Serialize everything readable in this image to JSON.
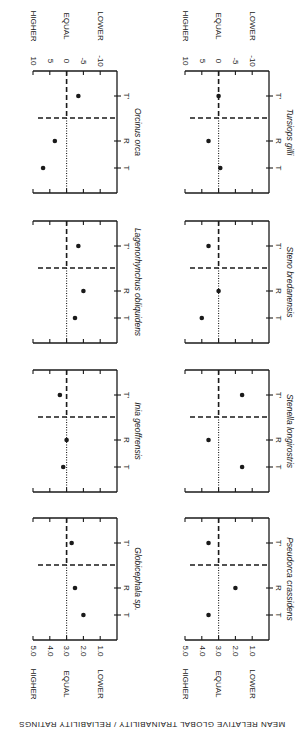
{
  "figure": {
    "ylabel": "MEAN RELATIVE GLOBAL TRAINABILITY / RELIABILITY RATINGS",
    "left_axis_ticks": [
      "5.0",
      "4.0",
      "3.0",
      "2.0",
      "1.0"
    ],
    "right_axis_ticks": [
      "10",
      "5",
      "0",
      "-5",
      "-10"
    ],
    "level_labels": [
      "HIGHER",
      "EQUAL",
      "LOWER"
    ],
    "categories": [
      "T",
      "R",
      "T'"
    ]
  },
  "chart_data": [
    {
      "type": "scatter",
      "title": "Globicephala sp.",
      "column": 0,
      "row": 3,
      "axis": "left",
      "categories": [
        "T",
        "R",
        "T'"
      ],
      "values": [
        2.0,
        2.5,
        2.7
      ],
      "ylim": [
        1.0,
        5.0
      ],
      "reference": 3.0
    },
    {
      "type": "scatter",
      "title": "Inia geoffrensis",
      "column": 0,
      "row": 2,
      "axis": "left",
      "categories": [
        "T",
        "R",
        "T'"
      ],
      "values": [
        3.2,
        3.0,
        3.4
      ],
      "ylim": [
        1.0,
        5.0
      ],
      "reference": 3.0
    },
    {
      "type": "scatter",
      "title": "Lagenorhynchus obliquidens",
      "column": 0,
      "row": 1,
      "axis": "left",
      "categories": [
        "T",
        "R",
        "T'"
      ],
      "values": [
        2.5,
        2.0,
        2.3
      ],
      "ylim": [
        1.0,
        5.0
      ],
      "reference": 3.0
    },
    {
      "type": "scatter",
      "title": "Orcinus orca",
      "column": 0,
      "row": 0,
      "axis": "right",
      "categories": [
        "T",
        "R",
        "T'"
      ],
      "values": [
        7,
        3.5,
        -3.5
      ],
      "ylim": [
        -10,
        10
      ],
      "reference": 0
    },
    {
      "type": "scatter",
      "title": "Pseudorca crassidens",
      "column": 1,
      "row": 3,
      "axis": "left",
      "categories": [
        "T",
        "R",
        "T'"
      ],
      "values": [
        3.6,
        2.0,
        3.6
      ],
      "ylim": [
        1.0,
        5.0
      ],
      "reference": 3.0
    },
    {
      "type": "scatter",
      "title": "Stenella longirostris",
      "column": 1,
      "row": 2,
      "axis": "left",
      "categories": [
        "T",
        "R",
        "T'"
      ],
      "values": [
        1.6,
        3.6,
        1.6
      ],
      "ylim": [
        1.0,
        5.0
      ],
      "reference": 3.0
    },
    {
      "type": "scatter",
      "title": "Steno bredanensis",
      "column": 1,
      "row": 1,
      "axis": "left",
      "categories": [
        "T",
        "R",
        "T'"
      ],
      "values": [
        4.0,
        3.0,
        3.6
      ],
      "ylim": [
        1.0,
        5.0
      ],
      "reference": 3.0
    },
    {
      "type": "scatter",
      "title": "Tursiops gilli",
      "column": 1,
      "row": 0,
      "axis": "right",
      "categories": [
        "T",
        "R",
        "T'"
      ],
      "values": [
        -0.5,
        3,
        0
      ],
      "ylim": [
        -10,
        10
      ],
      "reference": 0
    }
  ]
}
